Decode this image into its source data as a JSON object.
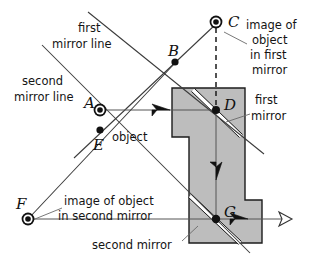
{
  "figure": {
    "type": "optics-ray-diagram"
  },
  "labels": {
    "first_mirror_line_l1": "first",
    "first_mirror_line_l2": "mirror line",
    "second_mirror_line_l1": "second",
    "second_mirror_line_l2": "mirror line",
    "image_first_l1": "image of",
    "image_first_l2": "object",
    "image_first_l3": "in first",
    "image_first_l4": "mirror",
    "first_mirror_l1": "first",
    "first_mirror_l2": "mirror",
    "object": "object",
    "image_second_l1": "image of object",
    "image_second_l2": "in second mirror",
    "second_mirror": "second mirror"
  },
  "points": {
    "A": {
      "label": "A",
      "x": 100,
      "y": 110,
      "marker": "ring"
    },
    "B": {
      "label": "B",
      "x": 175,
      "y": 62,
      "marker": "dot"
    },
    "C": {
      "label": "C",
      "x": 216,
      "y": 22,
      "marker": "ring"
    },
    "D": {
      "label": "D",
      "x": 216,
      "y": 110,
      "marker": "dot"
    },
    "E": {
      "label": "E",
      "x": 100,
      "y": 130,
      "marker": "dot"
    },
    "F": {
      "label": "F",
      "x": 28,
      "y": 219,
      "marker": "ring"
    },
    "G": {
      "label": "G",
      "x": 216,
      "y": 219,
      "marker": "dot"
    }
  },
  "colors": {
    "tube_fill": "#bdbdbd",
    "outline": "#1c1c1c",
    "mirror_glass": "#ffffff",
    "ray": "#555555",
    "text": "#141414"
  }
}
